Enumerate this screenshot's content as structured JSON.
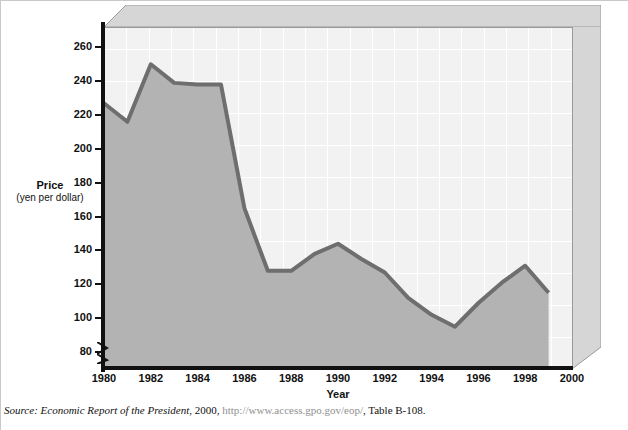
{
  "chart_data": {
    "type": "area",
    "title": "",
    "xlabel": "Year",
    "ylabel": "Price",
    "ylabel_sub": "(yen per dollar)",
    "x": [
      1980,
      1981,
      1982,
      1983,
      1984,
      1985,
      1986,
      1987,
      1988,
      1989,
      1990,
      1991,
      1992,
      1993,
      1994,
      1995,
      1996,
      1997,
      1998,
      1999
    ],
    "values": [
      227,
      216,
      250,
      239,
      238,
      238,
      165,
      128,
      128,
      138,
      144,
      135,
      127,
      112,
      102,
      95,
      109,
      121,
      131,
      115
    ],
    "series": [
      {
        "name": "Price (yen per dollar)",
        "values": [
          227,
          216,
          250,
          239,
          238,
          238,
          165,
          128,
          128,
          138,
          144,
          135,
          127,
          112,
          102,
          95,
          109,
          121,
          131,
          115
        ]
      }
    ],
    "xlim": [
      1980,
      2000
    ],
    "ylim": [
      70,
      272
    ],
    "xticks": [
      1980,
      1982,
      1984,
      1986,
      1988,
      1990,
      1992,
      1994,
      1996,
      1998,
      2000
    ],
    "xtick_labels": [
      "1980",
      "1982",
      "1984",
      "1986",
      "1988",
      "1990",
      "1992",
      "1994",
      "1996",
      "1998",
      "2000"
    ],
    "yticks": [
      80,
      100,
      120,
      140,
      160,
      180,
      200,
      220,
      240,
      260
    ],
    "ytick_labels": [
      "80",
      "100",
      "120",
      "140",
      "160",
      "180",
      "200",
      "220",
      "240",
      "260"
    ],
    "y_axis_break": true,
    "grid": true,
    "legend": "none",
    "colors": {
      "area_fill": "#b3b3b3",
      "line": "#6e6e6e",
      "plot_background": "#f2f2f2",
      "gridline": "#ffffff",
      "axis": "#111111",
      "bevel": "#d4d4d4"
    }
  },
  "source_note": {
    "lead": "Source: Economic Report of the President",
    "year": ", 2000, ",
    "url": "http://www.access.gpo.gov/eop/",
    "tail": ", Table B-108."
  }
}
